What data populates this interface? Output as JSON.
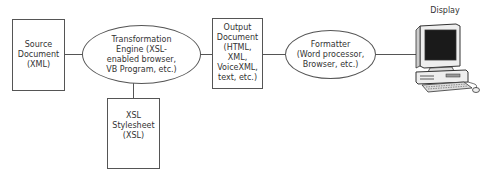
{
  "diagram": {
    "nodes": [
      {
        "id": "source",
        "shape": "rectangle",
        "lines": [
          "Source",
          "Document",
          "(XML)"
        ]
      },
      {
        "id": "engine",
        "shape": "ellipse",
        "lines": [
          "Transformation",
          "Engine (XSL-",
          "enabled browser,",
          "VB Program, etc.)"
        ]
      },
      {
        "id": "stylesheet",
        "shape": "rectangle",
        "lines": [
          "XSL",
          "Stylesheet",
          "(XSL)"
        ]
      },
      {
        "id": "output",
        "shape": "rectangle",
        "lines": [
          "Output",
          "Document",
          "(HTML,",
          "XML,",
          "VoiceXML,",
          "text, etc.)"
        ]
      },
      {
        "id": "formatter",
        "shape": "ellipse",
        "lines": [
          "Formatter",
          "(Word processor,",
          "Browser, etc.)"
        ]
      },
      {
        "id": "display",
        "shape": "computer-image",
        "label": "Display"
      }
    ],
    "edges": [
      {
        "from": "source",
        "to": "engine"
      },
      {
        "from": "engine",
        "to": "stylesheet"
      },
      {
        "from": "engine",
        "to": "output"
      },
      {
        "from": "output",
        "to": "formatter"
      },
      {
        "from": "formatter",
        "to": "display"
      }
    ]
  }
}
